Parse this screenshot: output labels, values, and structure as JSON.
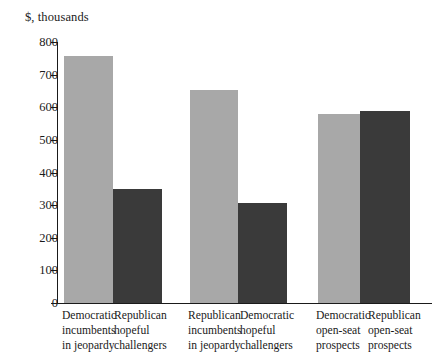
{
  "chart_data": {
    "type": "bar",
    "title": "",
    "subtitle": "",
    "ylabel": "$, thousands",
    "xlabel": "",
    "ylim": [
      0,
      800
    ],
    "yticks": [
      0,
      100,
      200,
      300,
      400,
      500,
      600,
      700,
      800
    ],
    "ytick_labels": [
      "0",
      "100",
      "200",
      "300",
      "400",
      "500",
      "600",
      "700",
      "800"
    ],
    "grid": false,
    "legend": "none",
    "groups": [
      {
        "bars": [
          {
            "category": "Democratic incumbents in jeopardy",
            "lines": [
              "Democratic",
              "incumbents",
              "in jeopardy"
            ],
            "value": 758,
            "color": "#a8a8a8",
            "series": "light"
          },
          {
            "category": "Republican hopeful challengers",
            "lines": [
              "Republican",
              "hopeful",
              "challengers"
            ],
            "value": 348,
            "color": "#3a3a3a",
            "series": "dark"
          }
        ]
      },
      {
        "bars": [
          {
            "category": "Republican incumbents in jeopardy",
            "lines": [
              "Republican",
              "incumbents",
              "in jeopardy"
            ],
            "value": 653,
            "color": "#a8a8a8",
            "series": "light"
          },
          {
            "category": "Democratic hopeful challengers",
            "lines": [
              "Democratic",
              "hopeful",
              "challengers"
            ],
            "value": 307,
            "color": "#3a3a3a",
            "series": "dark"
          }
        ]
      },
      {
        "bars": [
          {
            "category": "Democratic open-seat prospects",
            "lines": [
              "Democratic",
              "open-seat",
              "prospects"
            ],
            "value": 578,
            "color": "#a8a8a8",
            "series": "light"
          },
          {
            "category": "Republican open-seat prospects",
            "lines": [
              "Republican",
              "open-seat",
              "prospects"
            ],
            "value": 588,
            "color": "#3a3a3a",
            "series": "dark"
          }
        ]
      }
    ],
    "categories": [
      "Democratic incumbents in jeopardy",
      "Republican hopeful challengers",
      "Republican incumbents in jeopardy",
      "Democratic hopeful challengers",
      "Democratic open-seat prospects",
      "Republican open-seat prospects"
    ],
    "values": [
      758,
      348,
      653,
      307,
      578,
      588
    ],
    "colors": {
      "light_bar": "#a8a8a8",
      "dark_bar": "#3a3a3a",
      "axis": "#1a1a1a",
      "background": "#ffffff"
    }
  },
  "geometry": {
    "baseline_y": 303,
    "top_y": 42,
    "axis_left_x": 57,
    "bar_layout": [
      {
        "x": 64,
        "w": 49
      },
      {
        "x": 113,
        "w": 49
      },
      {
        "x": 190,
        "w": 48
      },
      {
        "x": 238,
        "w": 49
      },
      {
        "x": 318,
        "w": 42
      },
      {
        "x": 360,
        "w": 50
      }
    ],
    "label_x": [
      62,
      114,
      188,
      240,
      316,
      368
    ]
  }
}
